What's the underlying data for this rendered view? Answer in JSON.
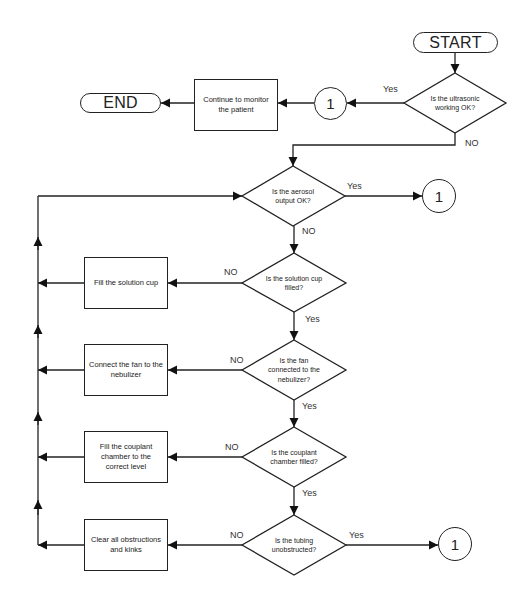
{
  "start": {
    "label": "START"
  },
  "end": {
    "label": "END"
  },
  "decisions": [
    {
      "id": "ultrasonic",
      "text": "Is the ultrasonic\nworking OK?",
      "yes": "Yes",
      "no": "NO"
    },
    {
      "id": "aerosol",
      "text": "Is the aerosol\noutput OK?",
      "yes": "Yes",
      "no": "NO"
    },
    {
      "id": "solution-cup",
      "text": "Is the solution cup\nfilled?",
      "yes": "Yes",
      "no": "NO"
    },
    {
      "id": "fan",
      "text": "Is the fan\nconnected to the\nnebulizer?",
      "yes": "Yes",
      "no": "NO"
    },
    {
      "id": "couplant",
      "text": "Is the couplant\nchamber filled?",
      "yes": "Yes",
      "no": "NO"
    },
    {
      "id": "tubing",
      "text": "Is the tubing\nunobstructed?",
      "yes": "Yes",
      "no": "NO"
    }
  ],
  "actions": [
    {
      "id": "monitor",
      "text": "Continue to monitor\nthe patient"
    },
    {
      "id": "fill-cup",
      "text": "Fill the solution cup"
    },
    {
      "id": "connect-fan",
      "text": "Connect the fan to the\nnebulizer"
    },
    {
      "id": "fill-couplant",
      "text": "Fill the couplant\nchamber to the\ncorrect level"
    },
    {
      "id": "clear",
      "text": "Clear all obstructions\nand kinks"
    }
  ],
  "connectors": [
    {
      "label": "1"
    },
    {
      "label": "1"
    },
    {
      "label": "1"
    }
  ]
}
